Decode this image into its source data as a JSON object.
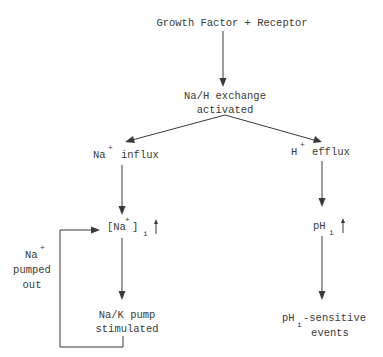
{
  "diagram": {
    "title": "Growth Factor + Receptor",
    "nodes": {
      "exchange": {
        "line1": "Na/H exchange",
        "line2": "activated"
      },
      "na_influx": {
        "ion": "Na",
        "charge": "+",
        "text": "influx"
      },
      "h_efflux": {
        "ion": "H",
        "charge": "+",
        "text": "efflux"
      },
      "na_conc": {
        "open": "[Na",
        "charge": "+",
        "close": "]",
        "sub": "i",
        "trend": "↑"
      },
      "ph": {
        "main": "pH",
        "sub": "i",
        "trend": "↑"
      },
      "pump": {
        "line1": "Na/K pump",
        "line2": "stimulated"
      },
      "ph_events": {
        "main": "pH",
        "sub": "i",
        "rest": "-sensitive",
        "line2": "events"
      },
      "feedback": {
        "ion": "Na",
        "charge": "+",
        "line2": "pumped",
        "line3": "out"
      }
    },
    "colors": {
      "ink": "#3a3a3a",
      "background": "#ffffff"
    }
  }
}
